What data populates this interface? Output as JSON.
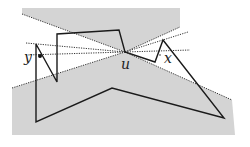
{
  "diagram": {
    "type": "geometric-visibility-figure",
    "colors": {
      "shade": "#d4d4d4",
      "polygon_stroke": "#1a1a1a",
      "dotted_stroke": "#333333",
      "background": "#ffffff"
    },
    "labels": {
      "u": "u",
      "x": "x",
      "y": "y"
    },
    "points": {
      "u": [
        125,
        52
      ],
      "x": [
        160,
        57
      ],
      "y": [
        40,
        56
      ]
    },
    "shaded_regions": [
      {
        "name": "upper-wedge",
        "points": [
          [
            22,
            8
          ],
          [
            180,
            8
          ],
          [
            180,
            27
          ],
          [
            125,
            52
          ],
          [
            22,
            14
          ]
        ]
      },
      {
        "name": "lower-wedge",
        "points": [
          [
            12,
            88
          ],
          [
            125,
            52
          ],
          [
            232,
            100
          ],
          [
            235,
            135
          ],
          [
            12,
            135
          ]
        ]
      }
    ],
    "polygon": [
      [
        36,
        44
      ],
      [
        36,
        122
      ],
      [
        112,
        88
      ],
      [
        224,
        118
      ],
      [
        163,
        40
      ],
      [
        155,
        62
      ],
      [
        125,
        52
      ],
      [
        119,
        30
      ],
      [
        57,
        34
      ],
      [
        57,
        82
      ]
    ],
    "dotted_lines": [
      {
        "from": [
          22,
          14
        ],
        "to": [
          125,
          52
        ]
      },
      {
        "from": [
          26,
          43
        ],
        "to": [
          125,
          52
        ]
      },
      {
        "from": [
          26,
          55
        ],
        "to": [
          125,
          52
        ]
      },
      {
        "from": [
          12,
          88
        ],
        "to": [
          125,
          52
        ]
      },
      {
        "from": [
          125,
          52
        ],
        "to": [
          180,
          27
        ]
      },
      {
        "from": [
          125,
          52
        ],
        "to": [
          188,
          32
        ]
      },
      {
        "from": [
          125,
          52
        ],
        "to": [
          190,
          50
        ]
      },
      {
        "from": [
          125,
          52
        ],
        "to": [
          232,
          100
        ]
      }
    ]
  }
}
